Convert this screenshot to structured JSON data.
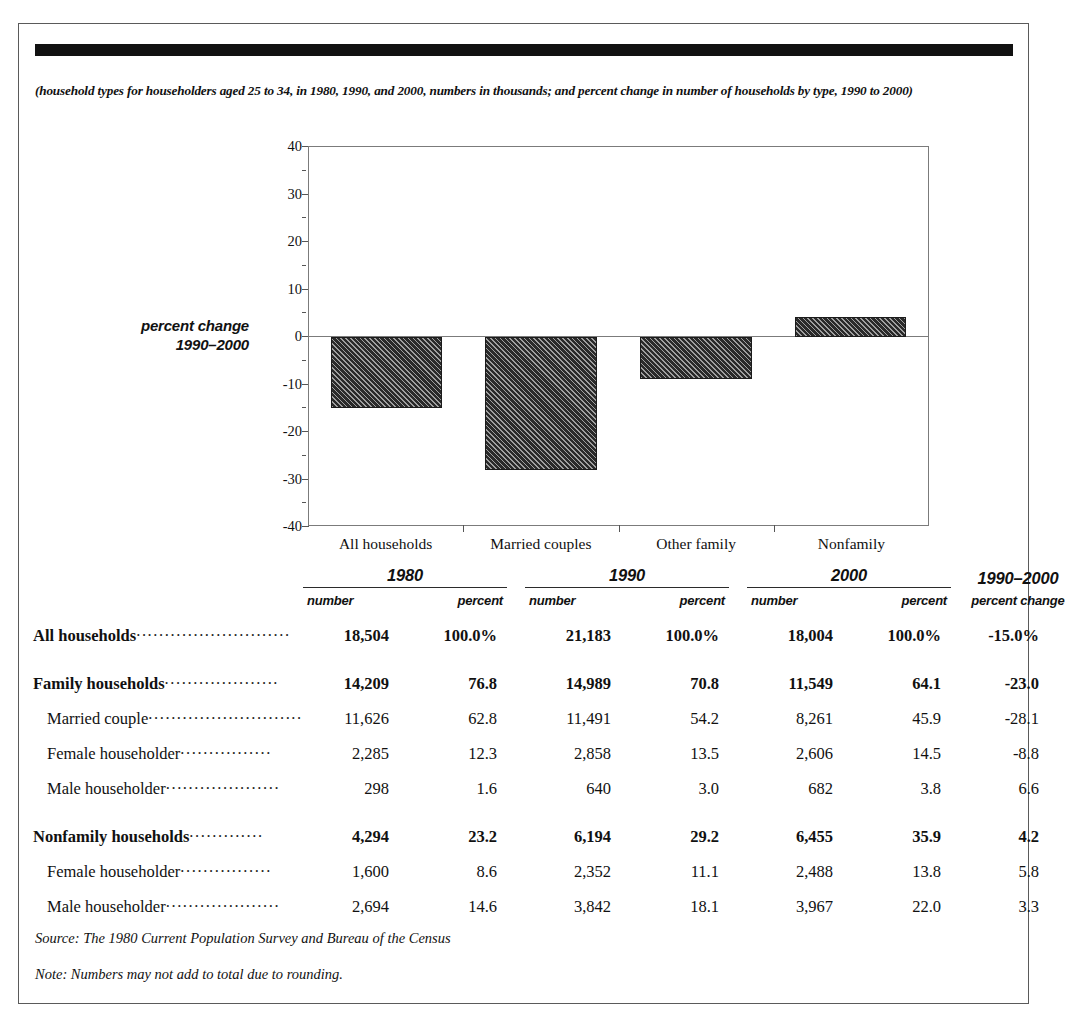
{
  "figure": {
    "caption": "(household types for householders aged 25 to 34, in 1980, 1990, and 2000, numbers in thousands; and percent change in number of households by type, 1990 to 2000)",
    "source": "Source: The 1980 Current Population Survey and Bureau of the Census",
    "note": "Note: Numbers may not add to total due to rounding."
  },
  "chart_data": {
    "type": "bar",
    "title": "",
    "ylabel": "percent change 1990–2000",
    "ylabel_line1": "percent change",
    "ylabel_line2": "1990–2000",
    "xlabel": "",
    "categories": [
      "All households",
      "Married couples",
      "Other family",
      "Nonfamily"
    ],
    "values": [
      -15.0,
      -28.1,
      -8.8,
      4.2
    ],
    "ylim": [
      -40,
      40
    ],
    "ytick_labels": [
      "40",
      "30",
      "20",
      "10",
      "0",
      "-10",
      "-20",
      "-30",
      "-40"
    ],
    "yticks": [
      40,
      30,
      20,
      10,
      0,
      -10,
      -20,
      -30,
      -40
    ],
    "yminor_ticks": [
      35,
      25,
      15,
      5,
      -5,
      -15,
      -25,
      -35
    ],
    "grid": false,
    "legend": "none",
    "bar_fill": "#2a2a2a",
    "bar_hatch": "diagonal"
  },
  "table": {
    "group_headers": [
      {
        "year": "1980",
        "number": "number",
        "percent": "percent"
      },
      {
        "year": "1990",
        "number": "number",
        "percent": "percent"
      },
      {
        "year": "2000",
        "number": "number",
        "percent": "percent"
      }
    ],
    "change_header": {
      "title": "1990–2000",
      "subtitle": "percent change"
    },
    "rows": [
      {
        "label": "All households",
        "leader": "...........................",
        "bold": true,
        "indent": false,
        "gap_above": false,
        "n1980": "18,504",
        "p1980": "100.0%",
        "n1990": "21,183",
        "p1990": "100.0%",
        "n2000": "18,004",
        "p2000": "100.0%",
        "change": "-15.0%"
      },
      {
        "label": "Family households",
        "leader": "....................",
        "bold": true,
        "indent": false,
        "gap_above": true,
        "n1980": "14,209",
        "p1980": "76.8",
        "n1990": "14,989",
        "p1990": "70.8",
        "n2000": "11,549",
        "p2000": "64.1",
        "change": "-23.0"
      },
      {
        "label": "Married couple",
        "leader": "...........................",
        "bold": false,
        "indent": true,
        "gap_above": false,
        "n1980": "11,626",
        "p1980": "62.8",
        "n1990": "11,491",
        "p1990": "54.2",
        "n2000": "8,261",
        "p2000": "45.9",
        "change": "-28.1"
      },
      {
        "label": "Female householder",
        "leader": "................",
        "bold": false,
        "indent": true,
        "gap_above": false,
        "n1980": "2,285",
        "p1980": "12.3",
        "n1990": "2,858",
        "p1990": "13.5",
        "n2000": "2,606",
        "p2000": "14.5",
        "change": "-8.8"
      },
      {
        "label": "Male householder",
        "leader": "....................",
        "bold": false,
        "indent": true,
        "gap_above": false,
        "n1980": "298",
        "p1980": "1.6",
        "n1990": "640",
        "p1990": "3.0",
        "n2000": "682",
        "p2000": "3.8",
        "change": "6.6"
      },
      {
        "label": "Nonfamily households",
        "leader": ".............",
        "bold": true,
        "indent": false,
        "gap_above": true,
        "n1980": "4,294",
        "p1980": "23.2",
        "n1990": "6,194",
        "p1990": "29.2",
        "n2000": "6,455",
        "p2000": "35.9",
        "change": "4.2"
      },
      {
        "label": "Female householder",
        "leader": "................",
        "bold": false,
        "indent": true,
        "gap_above": false,
        "n1980": "1,600",
        "p1980": "8.6",
        "n1990": "2,352",
        "p1990": "11.1",
        "n2000": "2,488",
        "p2000": "13.8",
        "change": "5.8"
      },
      {
        "label": "Male householder",
        "leader": "....................",
        "bold": false,
        "indent": true,
        "gap_above": false,
        "n1980": "2,694",
        "p1980": "14.6",
        "n1990": "3,842",
        "p1990": "18.1",
        "n2000": "3,967",
        "p2000": "22.0",
        "change": "3.3"
      }
    ]
  }
}
